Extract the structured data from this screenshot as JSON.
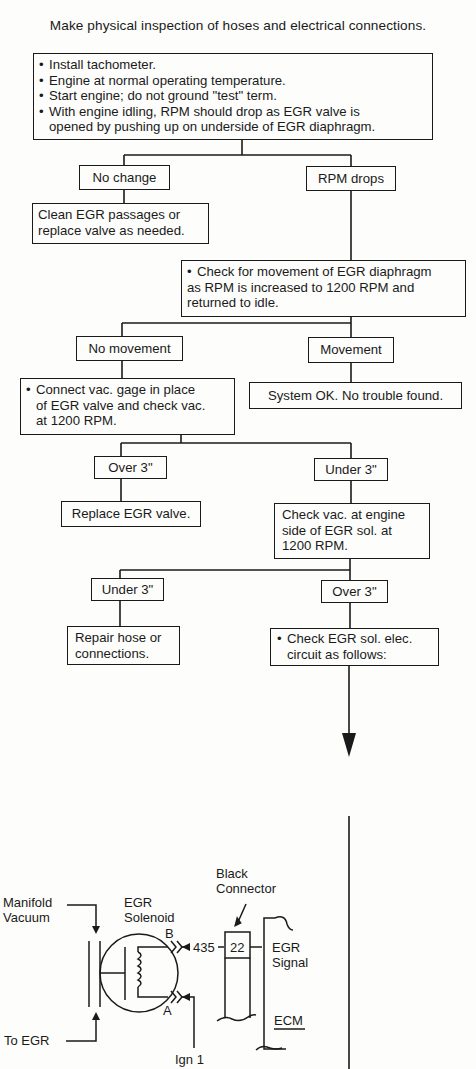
{
  "header": {
    "title": "Make physical inspection of hoses and electrical connections."
  },
  "flowchart": {
    "start": {
      "bullets": [
        "Install tachometer.",
        "Engine at normal operating temperature.",
        "Start engine; do not ground \"test\" term.",
        "With engine idling, RPM should drop as EGR valve is",
        "opened by pushing up on underside of EGR diaphragm."
      ]
    },
    "no_change": {
      "label": "No change"
    },
    "clean_egr": {
      "lines": [
        "Clean EGR passages or",
        "replace valve as needed."
      ]
    },
    "rpm_drops": {
      "label": "RPM drops"
    },
    "check_movement": {
      "lines": [
        "Check for movement of EGR diaphragm",
        "as RPM is increased to 1200 RPM and",
        "returned to idle."
      ]
    },
    "no_movement": {
      "label": "No movement"
    },
    "movement": {
      "label": "Movement"
    },
    "system_ok": {
      "label": "System OK. No trouble found."
    },
    "connect_gage": {
      "lines": [
        "Connect vac. gage in place",
        "of EGR valve and check vac.",
        "at 1200 RPM."
      ]
    },
    "over3_a": {
      "label": "Over 3\""
    },
    "under3_a": {
      "label": "Under 3\""
    },
    "replace_egr": {
      "label": "Replace EGR valve."
    },
    "check_vac_engine": {
      "lines": [
        "Check vac. at engine",
        "side of EGR sol. at",
        "1200 RPM."
      ]
    },
    "under3_b": {
      "label": "Under 3\""
    },
    "over3_b": {
      "label": "Over 3\""
    },
    "repair_hose": {
      "lines": [
        "Repair hose or",
        "connections."
      ]
    },
    "check_sol_circuit": {
      "lines": [
        "Check EGR sol. elec.",
        "circuit as follows:"
      ]
    }
  },
  "schematic": {
    "manifold_vacuum": [
      "Manifold",
      "Vacuum"
    ],
    "egr_solenoid": [
      "EGR",
      "Solenoid"
    ],
    "black_connector": [
      "Black",
      "Connector"
    ],
    "terminal_b": "B",
    "terminal_a": "A",
    "wire_number": "435",
    "pin_number": "22",
    "egr_signal": [
      "EGR",
      "Signal"
    ],
    "ecm": "ECM",
    "to_egr": "To EGR",
    "ign": "Ign 1"
  }
}
